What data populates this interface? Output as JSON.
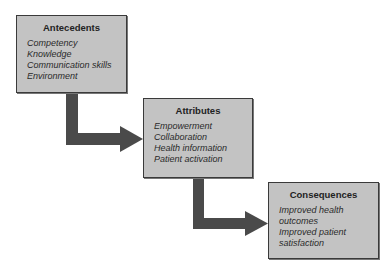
{
  "diagram": {
    "type": "flow",
    "boxes": [
      {
        "id": "antecedents",
        "title": "Antecedents",
        "items": [
          "Competency",
          "Knowledge",
          "Communication skills",
          "Environment"
        ]
      },
      {
        "id": "attributes",
        "title": "Attributes",
        "items": [
          "Empowerment",
          "Collaboration",
          "Health information",
          "Patient activation"
        ]
      },
      {
        "id": "consequences",
        "title": "Consequences",
        "items": [
          "Improved health",
          "outcomes",
          "Improved patient",
          "satisfaction"
        ]
      }
    ],
    "connections": [
      {
        "from": "antecedents",
        "to": "attributes"
      },
      {
        "from": "attributes",
        "to": "consequences"
      }
    ],
    "colors": {
      "box_fill": "#c3c3c3",
      "box_border": "#3a3a3a",
      "arrow": "#4a4a4a"
    }
  }
}
